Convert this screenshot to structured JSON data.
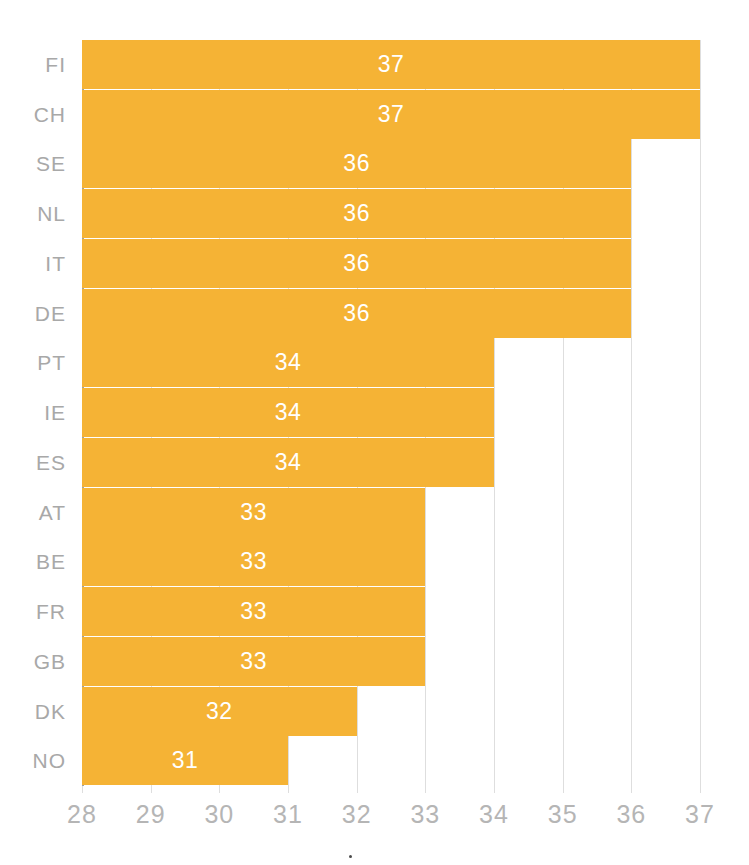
{
  "chart_data": {
    "type": "bar",
    "orientation": "horizontal",
    "title": "",
    "subtitle": "",
    "xlabel": "",
    "ylabel": "",
    "categories": [
      "FI",
      "CH",
      "SE",
      "NL",
      "IT",
      "DE",
      "PT",
      "IE",
      "ES",
      "AT",
      "BE",
      "FR",
      "GB",
      "DK",
      "NO"
    ],
    "values": [
      37,
      37,
      36,
      36,
      36,
      36,
      34,
      34,
      34,
      33,
      33,
      33,
      33,
      32,
      31
    ],
    "data_labels": [
      "37",
      "37",
      "36",
      "36",
      "36",
      "36",
      "34",
      "34",
      "34",
      "33",
      "33",
      "33",
      "33",
      "32",
      "31"
    ],
    "xlim": [
      28,
      37
    ],
    "ylim": null,
    "xticks": [
      28,
      29,
      30,
      31,
      32,
      33,
      34,
      35,
      36,
      37
    ],
    "xtick_labels": [
      "28",
      "29",
      "30",
      "31",
      "32",
      "33",
      "34",
      "35",
      "36",
      "37"
    ],
    "grid": "vertical",
    "legend": null,
    "legend_position": "none",
    "annotations": [],
    "colors": {
      "bar": "#f5b335",
      "data_label": "#ffffff",
      "category_label": "#a8a8a8",
      "tick_label": "#b5b5b5",
      "gridline": "#dedede",
      "axis_line": "#a0a0a0",
      "background": "#ffffff"
    }
  }
}
